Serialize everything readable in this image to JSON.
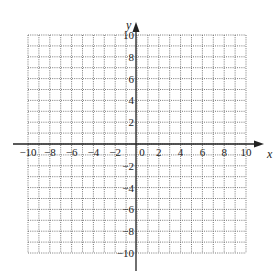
{
  "chart_data": {
    "type": "grid",
    "title": "",
    "xlabel": "x",
    "ylabel": "y",
    "xlim": [
      -10,
      10
    ],
    "ylim": [
      -10,
      10
    ],
    "grid": true,
    "grid_style": "dotted",
    "grid_step": 1,
    "x_tick_labels": [
      "-10",
      "-8",
      "-6",
      "-4",
      "-2",
      "0",
      "2",
      "4",
      "6",
      "8",
      "10"
    ],
    "y_tick_labels": [
      "10",
      "8",
      "6",
      "4",
      "2",
      "-2",
      "-4",
      "-6",
      "-8",
      "-10"
    ],
    "x_ticks": [
      -10,
      -8,
      -6,
      -4,
      -2,
      0,
      2,
      4,
      6,
      8,
      10
    ],
    "y_ticks": [
      10,
      8,
      6,
      4,
      2,
      -2,
      -4,
      -6,
      -8,
      -10
    ]
  },
  "axes": {
    "x_name": "x",
    "y_name": "y",
    "origin_label": "0"
  },
  "colors": {
    "grid": "#555555",
    "axis": "#222222"
  }
}
